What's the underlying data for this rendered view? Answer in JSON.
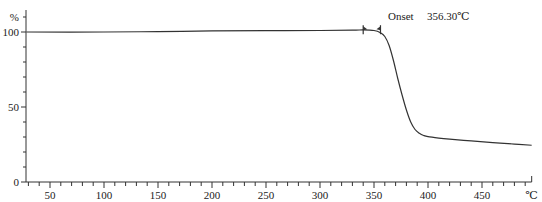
{
  "chart_data": {
    "type": "line",
    "title": "",
    "xlabel": "℃",
    "ylabel": "%",
    "xlim": [
      28,
      496
    ],
    "ylim": [
      0,
      100
    ],
    "grid": false,
    "legend": null,
    "x_ticks": [
      50,
      100,
      150,
      200,
      250,
      300,
      350,
      400,
      450
    ],
    "x_minor_step": 10,
    "y_ticks": [
      0,
      50,
      100
    ],
    "y_minor_step": 10,
    "annotation": {
      "label": "Onset",
      "value": "356.30℃",
      "marker_x": [
        340,
        356
      ]
    },
    "series": [
      {
        "name": "TGA weight %",
        "x": [
          28,
          100,
          150,
          200,
          250,
          300,
          330,
          340,
          350,
          356,
          360,
          364,
          368,
          372,
          376,
          380,
          384,
          388,
          392,
          396,
          400,
          410,
          420,
          440,
          460,
          480,
          496
        ],
        "y": [
          100,
          100,
          100.3,
          100.7,
          100.9,
          101.0,
          101.2,
          101.4,
          101.0,
          99.5,
          97.0,
          91.0,
          81.0,
          69.0,
          58.0,
          48.0,
          40.0,
          35.0,
          32.5,
          31.0,
          30.2,
          29.3,
          28.6,
          27.4,
          26.3,
          25.3,
          24.5
        ]
      }
    ]
  },
  "axes": {
    "y_unit": "%",
    "x_unit": "℃",
    "y_labels": [
      "100",
      "50",
      "0"
    ],
    "x_labels": [
      "50",
      "100",
      "150",
      "200",
      "250",
      "300",
      "350",
      "400",
      "450"
    ]
  },
  "annotation": {
    "label": "Onset",
    "value": "356.30℃"
  }
}
